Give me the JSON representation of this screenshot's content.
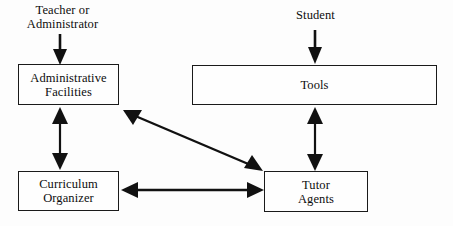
{
  "diagram": {
    "background_color": "#fdfdfd",
    "stroke_color": "#111111",
    "text_color": "#0d0d0d",
    "actors": [
      {
        "id": "teacher",
        "label": "Teacher or\nAdministrator"
      },
      {
        "id": "student",
        "label": "Student"
      }
    ],
    "nodes": [
      {
        "id": "administrative-facilities",
        "label": "Administrative\nFacilities"
      },
      {
        "id": "tools",
        "label": "Tools"
      },
      {
        "id": "curriculum-organizer",
        "label": "Curriculum\nOrganizer"
      },
      {
        "id": "tutor-agents",
        "label": "Tutor\nAgents"
      }
    ],
    "connectors": [
      {
        "id": "teacher-to-administrative-facilities",
        "from": "teacher",
        "to": "administrative-facilities",
        "arrow": "single-down"
      },
      {
        "id": "student-to-tools",
        "from": "student",
        "to": "tools",
        "arrow": "single-down"
      },
      {
        "id": "administrative-facilities-to-curriculum-organizer",
        "from": "administrative-facilities",
        "to": "curriculum-organizer",
        "arrow": "double-vertical"
      },
      {
        "id": "tools-to-tutor-agents",
        "from": "tools",
        "to": "tutor-agents",
        "arrow": "double-vertical"
      },
      {
        "id": "curriculum-organizer-to-tutor-agents",
        "from": "curriculum-organizer",
        "to": "tutor-agents",
        "arrow": "double-horizontal"
      },
      {
        "id": "administrative-facilities-to-tutor-agents",
        "from": "administrative-facilities",
        "to": "tutor-agents",
        "arrow": "double-diagonal"
      }
    ]
  }
}
